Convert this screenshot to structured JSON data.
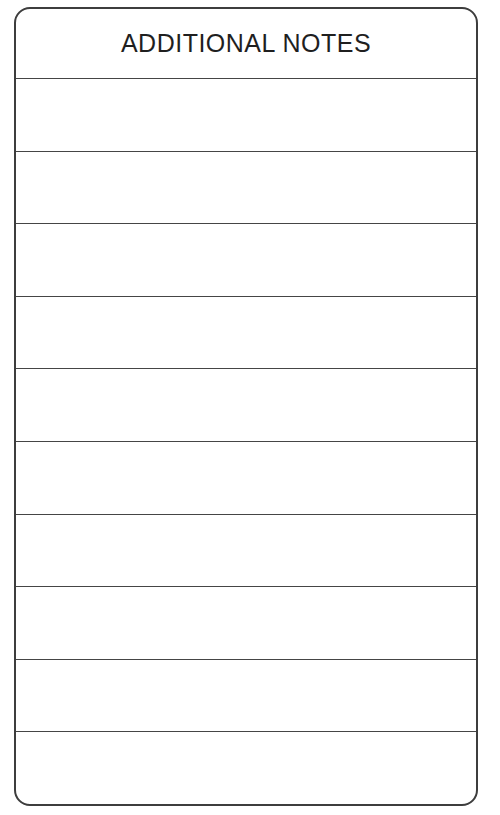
{
  "page": {
    "background_color": "#ffffff"
  },
  "card": {
    "title": "ADDITIONAL NOTES",
    "border_color": "#3d3d3d",
    "line_color": "#454545",
    "title_color": "#1f1f1f",
    "row_count": 10,
    "rows": [
      "",
      "",
      "",
      "",
      "",
      "",
      "",
      "",
      "",
      ""
    ]
  }
}
